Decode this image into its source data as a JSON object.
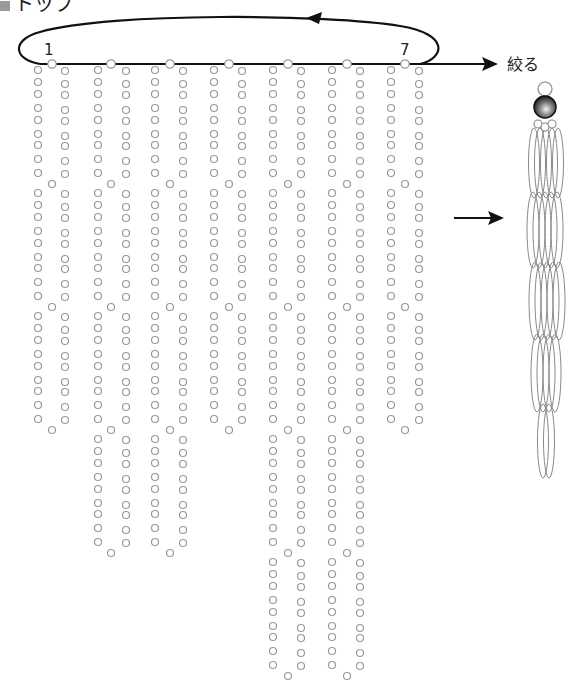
{
  "title": {
    "label": "トップ"
  },
  "labels": {
    "start_number": "1",
    "end_number": "7",
    "pull_label": "絞る"
  },
  "colors": {
    "bead_stroke": "#9a9a9a",
    "cord": "#111111",
    "tassel_stroke": "#8a8a8a"
  },
  "strands": [
    {
      "id": 1,
      "left_x": 38,
      "right_x": 65,
      "top_x": 52,
      "segments": 3
    },
    {
      "id": 2,
      "left_x": 98,
      "right_x": 126,
      "top_x": 111,
      "segments": 4
    },
    {
      "id": 3,
      "left_x": 155,
      "right_x": 183,
      "top_x": 170,
      "segments": 4
    },
    {
      "id": 4,
      "left_x": 214,
      "right_x": 242,
      "top_x": 229,
      "segments": 3
    },
    {
      "id": 5,
      "left_x": 273,
      "right_x": 301,
      "top_x": 288,
      "segments": 5
    },
    {
      "id": 6,
      "left_x": 332,
      "right_x": 360,
      "top_x": 347,
      "segments": 5
    },
    {
      "id": 7,
      "left_x": 391,
      "right_x": 419,
      "top_x": 405,
      "segments": 3
    }
  ],
  "segment_layout": {
    "first_row_y": 70,
    "row_offsets": [
      0,
      12,
      24,
      38,
      50,
      64,
      75,
      89,
      103
    ],
    "segment_pitch": 123,
    "cross_offset": 114,
    "bead_radius": 3.5
  },
  "cord": {
    "line_y": 64,
    "top_bead_y": 64
  },
  "tassel": {
    "top_bead": {
      "cx": 545,
      "cy": 89,
      "r": 7
    },
    "big_bead": {
      "cx": 545,
      "cy": 107,
      "r": 11
    },
    "small_beads": [
      {
        "cx": 538,
        "cy": 124,
        "r": 4
      },
      {
        "cx": 545,
        "cy": 127,
        "r": 4
      },
      {
        "cx": 552,
        "cy": 124,
        "r": 4
      }
    ]
  }
}
